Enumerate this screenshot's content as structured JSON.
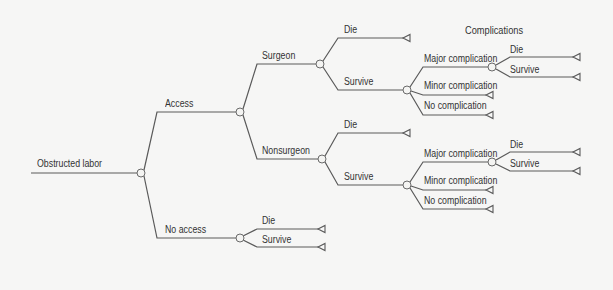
{
  "diagram": {
    "type": "decision-tree",
    "header": "Complications",
    "root": "Obstructed labor",
    "nodes": {
      "root": {
        "label": "Obstructed labor"
      },
      "access": {
        "label": "Access"
      },
      "no_access": {
        "label": "No access"
      },
      "surgeon": {
        "label": "Surgeon"
      },
      "nonsurgeon": {
        "label": "Nonsurgeon"
      },
      "surgeon_die": {
        "label": "Die"
      },
      "surgeon_survive": {
        "label": "Survive"
      },
      "surgeon_major": {
        "label": "Major complication"
      },
      "surgeon_minor": {
        "label": "Minor complication"
      },
      "surgeon_none": {
        "label": "No complication"
      },
      "surgeon_major_die": {
        "label": "Die"
      },
      "surgeon_major_survive": {
        "label": "Survive"
      },
      "nonsurgeon_die": {
        "label": "Die"
      },
      "nonsurgeon_survive": {
        "label": "Survive"
      },
      "nonsurgeon_major": {
        "label": "Major complication"
      },
      "nonsurgeon_minor": {
        "label": "Minor complication"
      },
      "nonsurgeon_none": {
        "label": "No complication"
      },
      "nonsurgeon_major_die": {
        "label": "Die"
      },
      "nonsurgeon_major_survive": {
        "label": "Survive"
      },
      "no_access_die": {
        "label": "Die"
      },
      "no_access_survive": {
        "label": "Survive"
      }
    },
    "legend": {
      "chance_node": "circle",
      "terminal_node": "triangle"
    },
    "colors": {
      "line": "#5a5a5a",
      "text": "#333333",
      "background": "#f6f6f5"
    }
  }
}
